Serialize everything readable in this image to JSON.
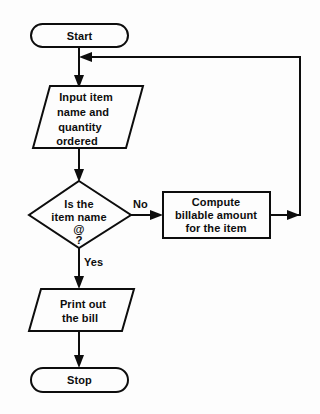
{
  "diagram": {
    "type": "flowchart",
    "background_color": "#fdfdfd",
    "line_color": "#0d0d0d",
    "nodes": [
      {
        "id": "start",
        "shape": "terminator",
        "label": "Start",
        "lines": [
          "Start"
        ]
      },
      {
        "id": "input",
        "shape": "parallelogram",
        "label": "Input item name and quantity ordered",
        "lines": [
          "Input item",
          "name and",
          "quantity",
          "ordered"
        ]
      },
      {
        "id": "decision",
        "shape": "diamond",
        "label": "Is the item name @ ?",
        "lines": [
          "Is the",
          "item name",
          "@",
          "?"
        ]
      },
      {
        "id": "compute",
        "shape": "process",
        "label": "Compute billable amount for the item",
        "lines": [
          "Compute",
          "billable amount",
          "for the item"
        ]
      },
      {
        "id": "print",
        "shape": "parallelogram",
        "label": "Print out the bill",
        "lines": [
          "Print out",
          "the bill"
        ]
      },
      {
        "id": "stop",
        "shape": "terminator",
        "label": "Stop",
        "lines": [
          "Stop"
        ]
      }
    ],
    "edges": [
      {
        "id": "start-to-input",
        "from": "start",
        "to": "input",
        "label": ""
      },
      {
        "id": "input-to-decision",
        "from": "input",
        "to": "decision",
        "label": ""
      },
      {
        "id": "decision-to-compute",
        "from": "decision",
        "to": "compute",
        "label": "No"
      },
      {
        "id": "decision-to-print",
        "from": "decision",
        "to": "print",
        "label": "Yes"
      },
      {
        "id": "compute-to-input-loop",
        "from": "compute",
        "to": "input",
        "label": ""
      },
      {
        "id": "print-to-stop",
        "from": "print",
        "to": "stop",
        "label": ""
      }
    ],
    "edge_labels": {
      "no": "No",
      "yes": "Yes"
    }
  }
}
